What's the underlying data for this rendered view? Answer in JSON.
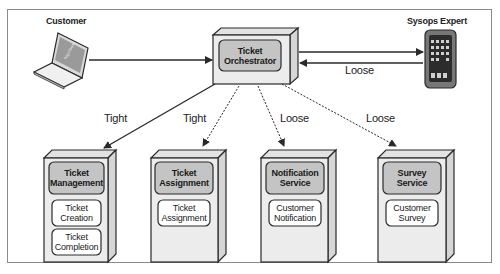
{
  "diagram": {
    "actors": {
      "customer": {
        "label": "Customer"
      },
      "sysops": {
        "label": "Sysops Expert"
      }
    },
    "orchestrator": {
      "title_line1": "Ticket",
      "title_line2": "Orchestrator"
    },
    "edges": {
      "orch_to_sysops_label": "Loose",
      "to_management": "Tight",
      "to_assignment": "Tight",
      "to_notification": "Loose",
      "to_survey": "Loose"
    },
    "services": [
      {
        "title_line1": "Ticket",
        "title_line2": "Management",
        "components": [
          {
            "line1": "Ticket",
            "line2": "Creation"
          },
          {
            "line1": "Ticket",
            "line2": "Completion"
          }
        ]
      },
      {
        "title_line1": "Ticket",
        "title_line2": "Assignment",
        "components": [
          {
            "line1": "Ticket",
            "line2": "Assignment"
          }
        ]
      },
      {
        "title_line1": "Notification",
        "title_line2": "Service",
        "components": [
          {
            "line1": "Customer",
            "line2": "Notification"
          }
        ]
      },
      {
        "title_line1": "Survey",
        "title_line2": "Service",
        "components": [
          {
            "line1": "Customer",
            "line2": "Survey"
          }
        ]
      }
    ],
    "colors": {
      "box_face": "#ececec",
      "box_side": "#d6d6d6",
      "box_top": "#e2e2e2",
      "title_fill": "#c4c4c4",
      "component_fill": "#ffffff",
      "stroke": "#2a2a2a"
    }
  }
}
